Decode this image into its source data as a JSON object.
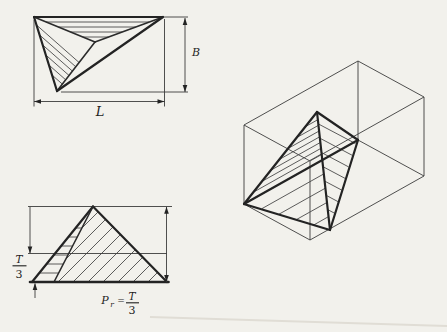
{
  "labels": {
    "top_view": {
      "length": "L",
      "breadth": "B"
    },
    "front_view": {
      "third_numerator": "T",
      "third_denominator": "3",
      "pr_var": "P",
      "pr_sub": "r",
      "pr_equals": "=",
      "pr_numerator": "T",
      "pr_denominator": "3"
    }
  },
  "colors": {
    "ink": "#232323",
    "thin_ink": "#3c3c3c",
    "paper": "#f2f1ec"
  }
}
